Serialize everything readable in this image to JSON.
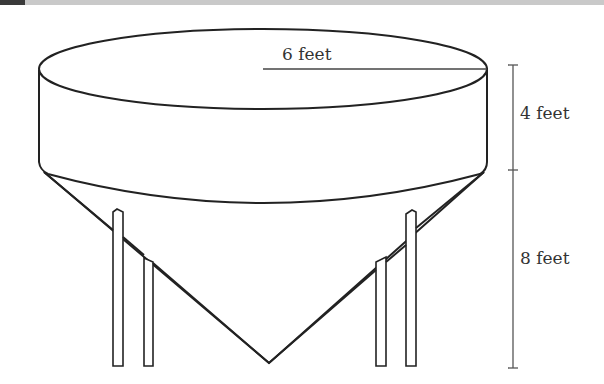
{
  "figure": {
    "type": "storage tank (cylinder on top of cone) with support legs",
    "labels": {
      "radius": "6 feet",
      "cylinder_height": "4 feet",
      "cone_height": "8 feet"
    },
    "colors": {
      "stroke": "#222222",
      "dimension_line": "#555555",
      "text": "#333333",
      "header_strip": "#c9c9c9",
      "header_block": "#3a3a3a"
    }
  }
}
